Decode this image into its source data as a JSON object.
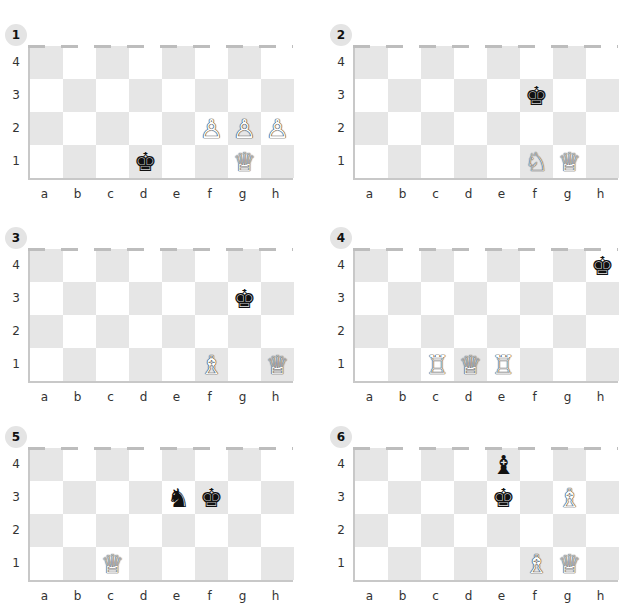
{
  "files": [
    "a",
    "b",
    "c",
    "d",
    "e",
    "f",
    "g",
    "h"
  ],
  "ranks": [
    "4",
    "3",
    "2",
    "1"
  ],
  "colors": {
    "light_square": "#ffffff",
    "dark_square": "#e6e6e6",
    "border": "#c8c8c8",
    "badge": "#e4e4e4"
  },
  "puzzles": [
    {
      "number": "1",
      "pieces": [
        {
          "square": "d1",
          "color": "black",
          "type": "king",
          "glyph": "♚"
        },
        {
          "square": "f2",
          "color": "white",
          "type": "pawn",
          "glyph": "♙"
        },
        {
          "square": "g2",
          "color": "white",
          "type": "pawn",
          "glyph": "♙"
        },
        {
          "square": "h2",
          "color": "white",
          "type": "pawn",
          "glyph": "♙"
        },
        {
          "square": "g1",
          "color": "white",
          "type": "queen",
          "glyph": "♕"
        }
      ]
    },
    {
      "number": "2",
      "pieces": [
        {
          "square": "f3",
          "color": "black",
          "type": "king",
          "glyph": "♚"
        },
        {
          "square": "f1",
          "color": "white",
          "type": "knight",
          "glyph": "♘"
        },
        {
          "square": "g1",
          "color": "white",
          "type": "queen",
          "glyph": "♕"
        }
      ]
    },
    {
      "number": "3",
      "pieces": [
        {
          "square": "g3",
          "color": "black",
          "type": "king",
          "glyph": "♚"
        },
        {
          "square": "f1",
          "color": "white",
          "type": "bishop",
          "glyph": "♗"
        },
        {
          "square": "h1",
          "color": "white",
          "type": "queen",
          "glyph": "♕"
        }
      ]
    },
    {
      "number": "4",
      "pieces": [
        {
          "square": "h4",
          "color": "black",
          "type": "king",
          "glyph": "♚"
        },
        {
          "square": "c1",
          "color": "white",
          "type": "rook",
          "glyph": "♖"
        },
        {
          "square": "d1",
          "color": "white",
          "type": "queen",
          "glyph": "♕"
        },
        {
          "square": "e1",
          "color": "white",
          "type": "rook",
          "glyph": "♖"
        }
      ]
    },
    {
      "number": "5",
      "pieces": [
        {
          "square": "e3",
          "color": "black",
          "type": "knight",
          "glyph": "♞"
        },
        {
          "square": "f3",
          "color": "black",
          "type": "king",
          "glyph": "♚"
        },
        {
          "square": "c1",
          "color": "white",
          "type": "queen",
          "glyph": "♕"
        }
      ]
    },
    {
      "number": "6",
      "pieces": [
        {
          "square": "e4",
          "color": "black",
          "type": "bishop",
          "glyph": "♝"
        },
        {
          "square": "e3",
          "color": "black",
          "type": "king",
          "glyph": "♚"
        },
        {
          "square": "g3",
          "color": "white",
          "type": "bishop",
          "glyph": "♗"
        },
        {
          "square": "f1",
          "color": "white",
          "type": "bishop",
          "glyph": "♗"
        },
        {
          "square": "g1",
          "color": "white",
          "type": "queen",
          "glyph": "♕"
        }
      ]
    }
  ]
}
